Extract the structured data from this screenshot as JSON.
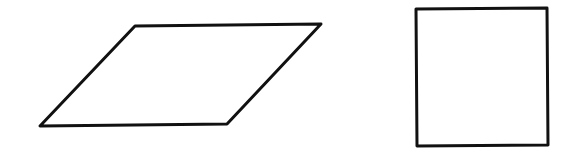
{
  "canvas": {
    "width": 572,
    "height": 148,
    "background": "#ffffff"
  },
  "shapes": [
    {
      "name": "parallelogram",
      "type": "polygon",
      "points": [
        [
          135,
          26
        ],
        [
          321,
          24
        ],
        [
          227,
          124
        ],
        [
          40,
          126
        ]
      ],
      "stroke": "#111111",
      "stroke_width": 3,
      "fill": "none"
    },
    {
      "name": "square",
      "type": "polygon",
      "points": [
        [
          416,
          9
        ],
        [
          547,
          8
        ],
        [
          548,
          145
        ],
        [
          417,
          146
        ]
      ],
      "stroke": "#111111",
      "stroke_width": 3,
      "fill": "none"
    }
  ]
}
